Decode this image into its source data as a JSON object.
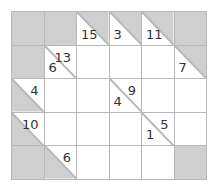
{
  "puzzle": {
    "type": "kakuro",
    "rows": 5,
    "cols": 6,
    "colors": {
      "block": "#cfcfcf",
      "white": "#ffffff",
      "line": "#b8b8b8",
      "text": "#333333"
    },
    "cells": [
      [
        {
          "kind": "block"
        },
        {
          "kind": "block"
        },
        {
          "kind": "clue",
          "down": "15"
        },
        {
          "kind": "clue",
          "down": "3"
        },
        {
          "kind": "clue",
          "down": "11"
        },
        {
          "kind": "block"
        }
      ],
      [
        {
          "kind": "block"
        },
        {
          "kind": "split",
          "down": "6",
          "across": "13"
        },
        {
          "kind": "entry"
        },
        {
          "kind": "entry"
        },
        {
          "kind": "entry"
        },
        {
          "kind": "clue",
          "down": "7"
        }
      ],
      [
        {
          "kind": "clue",
          "across": "4"
        },
        {
          "kind": "entry"
        },
        {
          "kind": "entry"
        },
        {
          "kind": "split",
          "down": "4",
          "across": "9"
        },
        {
          "kind": "entry"
        },
        {
          "kind": "entry"
        }
      ],
      [
        {
          "kind": "clue",
          "across": "10"
        },
        {
          "kind": "entry"
        },
        {
          "kind": "entry"
        },
        {
          "kind": "entry"
        },
        {
          "kind": "split",
          "down": "1",
          "across": "5"
        },
        {
          "kind": "entry"
        }
      ],
      [
        {
          "kind": "block"
        },
        {
          "kind": "clue",
          "across": "6"
        },
        {
          "kind": "entry"
        },
        {
          "kind": "entry"
        },
        {
          "kind": "entry"
        },
        {
          "kind": "block"
        }
      ]
    ]
  }
}
